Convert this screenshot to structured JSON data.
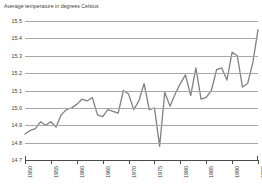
{
  "chart_data": {
    "type": "line",
    "title": "Average temperature in degrees Celsius",
    "xlabel": "",
    "ylabel": "",
    "ylim": [
      14.7,
      15.5
    ],
    "xlim": [
      1950,
      1995
    ],
    "grid": true,
    "legend": "none",
    "line_color": "#808080",
    "ytick_labels": [
      "15.5",
      "15.4",
      "15.3",
      "15.2",
      "15.1",
      "15.0",
      "14.9",
      "14.8",
      "14.7"
    ],
    "ytick_values": [
      15.5,
      15.4,
      15.3,
      15.2,
      15.1,
      15.0,
      14.9,
      14.8,
      14.7
    ],
    "xtick_labels": [
      "1950",
      "1955",
      "1960",
      "1965",
      "1970",
      "1975",
      "1980",
      "1985",
      "1990",
      "1995"
    ],
    "xtick_values": [
      1950,
      1955,
      1960,
      1965,
      1970,
      1975,
      1980,
      1985,
      1990,
      1995
    ],
    "x": [
      1950,
      1951,
      1952,
      1953,
      1954,
      1955,
      1956,
      1957,
      1958,
      1959,
      1960,
      1961,
      1962,
      1963,
      1964,
      1965,
      1966,
      1967,
      1968,
      1969,
      1970,
      1971,
      1972,
      1973,
      1974,
      1975,
      1976,
      1977,
      1978,
      1979,
      1980,
      1981,
      1982,
      1983,
      1984,
      1985,
      1986,
      1987,
      1988,
      1989,
      1990,
      1991,
      1992,
      1993,
      1994,
      1995
    ],
    "values": [
      14.85,
      14.87,
      14.88,
      14.92,
      14.9,
      14.92,
      14.89,
      14.96,
      14.99,
      15.0,
      15.02,
      15.05,
      15.04,
      15.06,
      14.96,
      14.95,
      14.99,
      14.98,
      14.97,
      15.1,
      15.08,
      14.99,
      15.04,
      15.14,
      14.99,
      15.0,
      14.78,
      15.09,
      15.01,
      15.08,
      15.14,
      15.19,
      15.07,
      15.23,
      15.05,
      15.06,
      15.1,
      15.22,
      15.23,
      15.16,
      15.32,
      15.3,
      15.12,
      15.14,
      15.26,
      15.45
    ]
  }
}
